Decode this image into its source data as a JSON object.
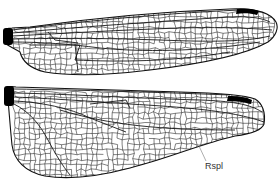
{
  "figure": {
    "type": "dragonfly-wing-venation-illustration",
    "background": "#ffffff",
    "vein_color": "#1a1a1a",
    "pterostigma_color": "#000000",
    "wings": [
      {
        "id": "forewing",
        "name": "Forewing",
        "outline": "M5,33 C4,30 7,28 12,28 L30,27 C80,20 150,12 230,9 C255,8 270,12 276,22 C279,28 276,36 268,42 C245,55 200,64 150,70 C110,75 70,76 45,72 C28,68 22,60 20,52 C14,48 8,46 5,43 Z",
        "base_block": {
          "x": 3,
          "y": 28,
          "w": 10,
          "h": 17
        },
        "pterostigma": "M237,9 C246,8 254,9 259,11 L257,15 C250,13 243,13 236,14 Z",
        "longitudinal": [
          "M12,30 C80,22 150,14 240,10",
          "M12,33 C80,27 150,22 230,17 C250,16 262,18 270,22",
          "M12,36 C70,33 120,30 180,28 C220,27 250,28 272,30",
          "M12,39 C60,38 110,38 160,40 C210,42 245,42 270,36",
          "M12,42 C40,42 70,44 100,48 C140,52 200,52 260,42",
          "M30,45 L80,45 L75,60 C120,62 170,62 230,52",
          "M48,32 L55,40 L78,43",
          "M75,44 L78,72"
        ],
        "region": {
          "x0": 14,
          "x1": 272,
          "y0": 12,
          "y1": 74
        }
      },
      {
        "id": "hindwing",
        "name": "Hindwing",
        "outline": "M5,90 C6,87 10,86 16,87 C60,88 120,90 180,92 C220,93 245,95 255,99 C262,103 266,112 264,124 C262,130 250,134 235,136 C200,144 170,158 130,168 C100,176 70,180 45,176 C25,172 14,160 12,145 C10,125 9,110 8,100 C6,97 5,94 5,90 Z",
        "base_block": {
          "x": 4,
          "y": 86,
          "w": 10,
          "h": 20
        },
        "pterostigma": "M228,96 C238,96 246,97 252,100 L251,104 C244,102 236,101 227,101 Z",
        "longitudinal": [
          "M14,89 C80,90 150,92 230,95",
          "M14,93 C70,94 126,98 200,100 C230,101 250,104 262,112",
          "M14,97 C60,99 100,102 130,104 C180,107 230,110 264,122",
          "M14,101 C40,102 70,108 90,118 L126,132",
          "M14,104 C30,112 40,125 48,140 C56,155 62,165 70,175",
          "M90,104 L126,100 L130,108",
          "M60,110 C110,125 160,130 235,130"
        ],
        "region": {
          "x0": 14,
          "x1": 262,
          "y0": 92,
          "y1": 178
        }
      }
    ],
    "annotations": [
      {
        "id": "rspl",
        "text": "Rspl",
        "leader_line": {
          "x1": 199,
          "y1": 146,
          "x2": 206,
          "y2": 161
        },
        "label_pos": {
          "left": 205,
          "top": 162
        }
      }
    ]
  }
}
